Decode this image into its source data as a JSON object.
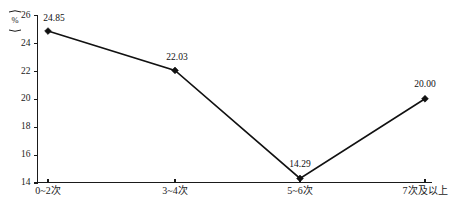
{
  "chart_data": {
    "type": "line",
    "title": "",
    "xlabel": "",
    "ylabel": "(%)",
    "y_unit": "%",
    "categories": [
      "0~2次",
      "3~4次",
      "5~6次",
      "7次及以上"
    ],
    "values": [
      24.85,
      22.03,
      14.29,
      20.0
    ],
    "point_labels": [
      "24.85",
      "22.03",
      "14.29",
      "20.00"
    ],
    "yticks": [
      14,
      16,
      18,
      20,
      22,
      24,
      26
    ],
    "ytick_labels": [
      "14",
      "16",
      "18",
      "20",
      "22",
      "24",
      "26"
    ],
    "ylim": [
      14,
      26
    ],
    "grid": false,
    "legend": null,
    "series": [
      {
        "name": "",
        "values": [
          24.85,
          22.03,
          14.29,
          20.0
        ],
        "color": "#111111",
        "marker": "diamond"
      }
    ]
  },
  "axis": {
    "y_label_text": "%",
    "y_label_open_paren": "⁀",
    "y_label_close_paren": "⁀"
  }
}
